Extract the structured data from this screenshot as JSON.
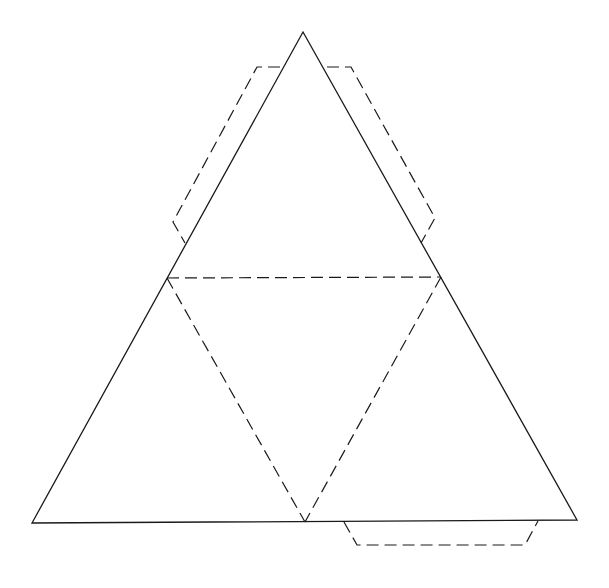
{
  "diagram": {
    "type": "tetrahedron-net",
    "colors": {
      "background": "#ffffff",
      "line": "#1a1a1a"
    },
    "vertices": {
      "apex": [
        303,
        32
      ],
      "mid_left": [
        167,
        278
      ],
      "mid_right": [
        441,
        277
      ],
      "bottom_left": [
        32,
        523
      ],
      "bottom_mid": [
        305,
        522
      ],
      "bottom_right": [
        577,
        520
      ]
    },
    "outline_solid": "303,32 577,520 32,523",
    "fold_lines_dashed": [
      "167,278 441,277",
      "167,278 305,522",
      "441,277 305,522"
    ],
    "tabs_dashed": {
      "left_tab": "280,67 257,67 173,222 185,243",
      "right_tab": "327,67 351,67 435,218 421,243",
      "bottom_tab": "344,522 357,545 525,545 538,521"
    }
  }
}
